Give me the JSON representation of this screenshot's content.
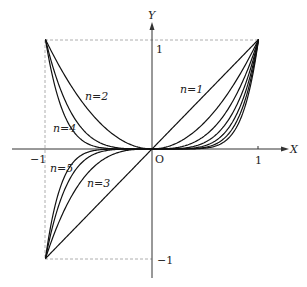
{
  "chart_data": {
    "type": "line",
    "title": "",
    "function": "y = x^n",
    "xlabel": "X",
    "ylabel": "Y",
    "xlim": [
      -1.3,
      1.3
    ],
    "ylim": [
      -1.2,
      1.3
    ],
    "grid": false,
    "legend": "inline labels",
    "x_ticks": [
      {
        "value": -1,
        "label": "−1"
      },
      {
        "value": 1,
        "label": "1"
      }
    ],
    "y_ticks": [
      {
        "value": 1,
        "label": "1"
      },
      {
        "value": -1,
        "label": "−1"
      }
    ],
    "origin_label": "O",
    "guide_lines": "dashed box from (−1,−1) to (1,1) on left/top/bottom",
    "series": [
      {
        "name": "n=1",
        "exponent": 1,
        "label_pos": [
          0.35,
          0.54
        ]
      },
      {
        "name": "n=2",
        "exponent": 2,
        "label_pos": [
          -0.55,
          0.49
        ]
      },
      {
        "name": "n=3",
        "exponent": 3,
        "label_pos": [
          -0.5,
          -0.32
        ]
      },
      {
        "name": "n=4",
        "exponent": 4,
        "label_pos": [
          -0.8,
          0.2
        ]
      },
      {
        "name": "n=5",
        "exponent": 5,
        "label_pos": [
          -0.86,
          -0.18
        ]
      },
      {
        "name": "n=6",
        "exponent": 6,
        "label_pos": null
      },
      {
        "name": "n=7",
        "exponent": 7,
        "label_pos": null
      }
    ],
    "sample_points": {
      "x": [
        -1,
        -0.75,
        -0.5,
        -0.25,
        0,
        0.25,
        0.5,
        0.75,
        1
      ],
      "n=1": [
        -1,
        -0.75,
        -0.5,
        -0.25,
        0,
        0.25,
        0.5,
        0.75,
        1
      ],
      "n=2": [
        1,
        0.5625,
        0.25,
        0.0625,
        0,
        0.0625,
        0.25,
        0.5625,
        1
      ],
      "n=3": [
        -1,
        -0.4219,
        -0.125,
        -0.0156,
        0,
        0.0156,
        0.125,
        0.4219,
        1
      ],
      "n=4": [
        1,
        0.3164,
        0.0625,
        0.0039,
        0,
        0.0039,
        0.0625,
        0.3164,
        1
      ],
      "n=5": [
        -1,
        -0.2373,
        -0.0313,
        -0.001,
        0,
        0.001,
        0.0313,
        0.2373,
        1
      ]
    }
  },
  "axis": {
    "x_label": "X",
    "y_label": "Y",
    "origin": "O",
    "x_neg": "−1",
    "x_pos": "1",
    "y_pos": "1",
    "y_neg": "−1"
  },
  "curve_labels": {
    "n1": "n=1",
    "n2": "n=2",
    "n3": "n=3",
    "n4": "n=4",
    "n5": "n=5"
  }
}
